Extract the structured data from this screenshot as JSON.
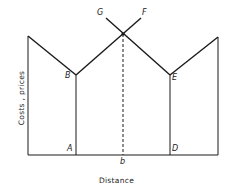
{
  "diagram": {
    "xlabel": "Distance",
    "ylabel": "Costs , prices",
    "points": {
      "G": "G",
      "F": "F",
      "B": "B",
      "E": "E",
      "A": "A",
      "D": "D",
      "b": "b"
    },
    "colors": {
      "line": "#1a1a1a",
      "background": "#ffffff"
    }
  }
}
